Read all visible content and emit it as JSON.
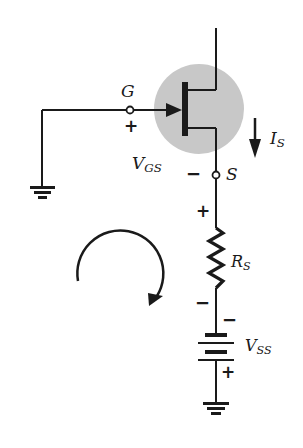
{
  "diagram": {
    "type": "circuit-schematic",
    "title": "",
    "colors": {
      "wire": "#1a1a1a",
      "highlight": "#c8c8c8",
      "background": "#ffffff"
    },
    "components": {
      "jfet": {
        "label": "n-channel JFET",
        "gate": "G",
        "source": "S"
      },
      "resistor": {
        "label_main": "R",
        "label_sub": "S"
      },
      "battery": {
        "label_main": "V",
        "label_sub": "SS"
      }
    },
    "labels": {
      "gate_terminal": "G",
      "source_terminal": "S",
      "vgs_main": "V",
      "vgs_sub": "GS",
      "current_main": "I",
      "current_sub": "S",
      "rs_main": "R",
      "rs_sub": "S",
      "vss_main": "V",
      "vss_sub": "SS"
    },
    "polarity": {
      "vgs_plus": "+",
      "vgs_minus": "−",
      "rs_plus": "+",
      "rs_minus": "−",
      "vss_minus": "−",
      "vss_plus": "+"
    },
    "annotations": {
      "loop_direction": "clockwise",
      "current_direction": "down"
    }
  }
}
